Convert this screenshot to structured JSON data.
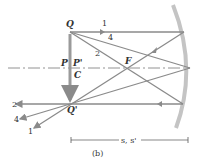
{
  "diagram": {
    "caption": "(b)",
    "points": {
      "Q": "Q",
      "Q_prime": "Q'",
      "P": "P",
      "P_prime": "P'",
      "C": "C",
      "F": "F"
    },
    "rays": [
      "1",
      "2",
      "4"
    ],
    "rays_bottom": [
      "2",
      "4",
      "1"
    ],
    "distance_label": "s, s'",
    "colors": {
      "ray": "#8a8a8a",
      "mirror": "#c4c4c4",
      "text": "#333333",
      "axis": "#777777"
    }
  }
}
